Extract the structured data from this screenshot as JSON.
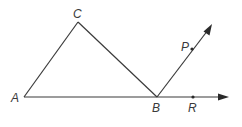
{
  "diagram": {
    "type": "geometry",
    "points": {
      "A": {
        "label": "A",
        "x": 24,
        "y": 97
      },
      "B": {
        "label": "B",
        "x": 157,
        "y": 97
      },
      "C": {
        "label": "C",
        "x": 78,
        "y": 22
      },
      "P": {
        "label": "P",
        "x": 192,
        "y": 49
      },
      "R": {
        "label": "R",
        "x": 193,
        "y": 97
      }
    },
    "segments": [
      "AC",
      "CB",
      "AB"
    ],
    "rays": [
      "BP",
      "BR"
    ],
    "line_color": "#3a3a3a"
  }
}
